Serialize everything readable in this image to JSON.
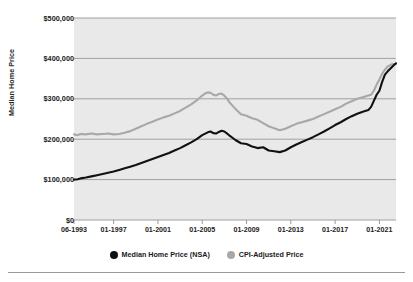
{
  "chart_data": {
    "type": "line",
    "title": "",
    "xlabel": "",
    "ylabel": "Median Home Price",
    "ylim": [
      0,
      500000
    ],
    "grid": true,
    "legend_position": "bottom-center",
    "plot_background": "#e9e9e9",
    "gridline_color": "#a0a0a0",
    "y_ticks": [
      "$0",
      "$100,000",
      "$200,000",
      "$300,000",
      "$400,000",
      "$500,000"
    ],
    "y_tick_values": [
      0,
      100000,
      200000,
      300000,
      400000,
      500000
    ],
    "x_ticks": [
      "06-1993",
      "01-1997",
      "01-2001",
      "01-2005",
      "01-2009",
      "01-2013",
      "01-2017",
      "01-2021"
    ],
    "x_tick_values": [
      1993.42,
      1997.0,
      2001.0,
      2005.0,
      2009.0,
      2013.0,
      2017.0,
      2021.0
    ],
    "xlim": [
      1993.42,
      2022.5
    ],
    "series": [
      {
        "name": "Median Home Price (NSA)",
        "color": "#111111",
        "marker": "circle",
        "x": [
          1993.42,
          1993.75,
          1994.0,
          1994.5,
          1995.0,
          1995.5,
          1996.0,
          1996.5,
          1997.0,
          1997.5,
          1998.0,
          1998.5,
          1999.0,
          1999.5,
          2000.0,
          2000.5,
          2001.0,
          2001.5,
          2002.0,
          2002.5,
          2003.0,
          2003.5,
          2004.0,
          2004.5,
          2005.0,
          2005.5,
          2005.75,
          2006.0,
          2006.25,
          2006.5,
          2006.75,
          2007.0,
          2007.25,
          2007.5,
          2008.0,
          2008.5,
          2009.0,
          2009.5,
          2010.0,
          2010.5,
          2011.0,
          2011.5,
          2012.0,
          2012.5,
          2013.0,
          2013.5,
          2014.0,
          2014.5,
          2015.0,
          2015.5,
          2016.0,
          2016.5,
          2017.0,
          2017.5,
          2018.0,
          2018.5,
          2019.0,
          2019.5,
          2020.0,
          2020.25,
          2020.5,
          2020.75,
          2021.0,
          2021.25,
          2021.5,
          2021.75,
          2022.0,
          2022.25,
          2022.5
        ],
        "values": [
          100000,
          101000,
          103000,
          105000,
          108000,
          111000,
          114000,
          117000,
          120000,
          124000,
          128000,
          132000,
          136000,
          141000,
          146000,
          151000,
          156000,
          161000,
          166000,
          172000,
          178000,
          185000,
          192000,
          200000,
          210000,
          217000,
          219000,
          215000,
          214000,
          218000,
          221000,
          219000,
          214000,
          208000,
          198000,
          190000,
          188000,
          182000,
          178000,
          180000,
          172000,
          170000,
          168000,
          172000,
          180000,
          187000,
          193000,
          199000,
          205000,
          212000,
          219000,
          227000,
          235000,
          242000,
          250000,
          257000,
          263000,
          268000,
          272000,
          280000,
          295000,
          310000,
          320000,
          342000,
          360000,
          368000,
          375000,
          382000,
          388000
        ]
      },
      {
        "name": "CPI-Adjusted Price",
        "color": "#a8a8a8",
        "marker": "circle",
        "x": [
          1993.42,
          1993.75,
          1994.0,
          1994.5,
          1995.0,
          1995.5,
          1996.0,
          1996.5,
          1997.0,
          1997.5,
          1998.0,
          1998.5,
          1999.0,
          1999.5,
          2000.0,
          2000.5,
          2001.0,
          2001.5,
          2002.0,
          2002.5,
          2003.0,
          2003.5,
          2004.0,
          2004.5,
          2005.0,
          2005.25,
          2005.5,
          2005.75,
          2006.0,
          2006.25,
          2006.5,
          2006.75,
          2007.0,
          2007.25,
          2007.5,
          2008.0,
          2008.5,
          2009.0,
          2009.5,
          2010.0,
          2010.5,
          2011.0,
          2011.5,
          2012.0,
          2012.5,
          2013.0,
          2013.5,
          2014.0,
          2014.5,
          2015.0,
          2015.5,
          2016.0,
          2016.5,
          2017.0,
          2017.5,
          2018.0,
          2018.5,
          2019.0,
          2019.5,
          2020.0,
          2020.25,
          2020.5,
          2020.75,
          2021.0,
          2021.25,
          2021.5,
          2021.75,
          2022.0,
          2022.25,
          2022.5
        ],
        "values": [
          212000,
          210000,
          213000,
          212000,
          214000,
          212000,
          213000,
          214000,
          212000,
          213000,
          216000,
          220000,
          226000,
          232000,
          238000,
          243000,
          249000,
          254000,
          258000,
          264000,
          270000,
          278000,
          286000,
          296000,
          308000,
          313000,
          316000,
          315000,
          310000,
          308000,
          312000,
          313000,
          308000,
          300000,
          290000,
          275000,
          262000,
          258000,
          252000,
          248000,
          240000,
          232000,
          227000,
          222000,
          226000,
          232000,
          238000,
          242000,
          246000,
          250000,
          256000,
          262000,
          268000,
          274000,
          280000,
          288000,
          294000,
          300000,
          304000,
          308000,
          310000,
          320000,
          335000,
          348000,
          362000,
          372000,
          380000,
          384000,
          386000,
          386000
        ]
      }
    ]
  },
  "axes": {
    "y_title": "Median Home Price"
  }
}
